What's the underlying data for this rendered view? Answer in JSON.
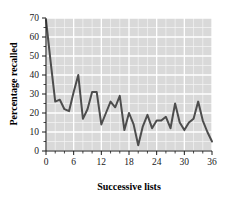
{
  "chart_data": {
    "type": "line",
    "title": "",
    "subtitle": "",
    "xlabel": "Successive lists",
    "ylabel": "Percentage recalled",
    "xlim": [
      0,
      36
    ],
    "ylim": [
      0,
      70
    ],
    "xticks": [
      0,
      6,
      12,
      18,
      24,
      30,
      36
    ],
    "xtick_labels": [
      "0",
      "6",
      "12",
      "18",
      "24",
      "30",
      "36"
    ],
    "xminor_step": 2,
    "yticks": [
      0,
      10,
      20,
      30,
      40,
      50,
      60,
      70
    ],
    "ytick_labels": [
      "0",
      "10",
      "20",
      "30",
      "40",
      "50",
      "60",
      "70"
    ],
    "yminor_step": 5,
    "grid": true,
    "grid_color": "#ffffff",
    "plot_background": "#d9d9d9",
    "line_color": "#4d4d4d",
    "line_width": 2,
    "legend": null,
    "legend_position": "none",
    "annotations": [],
    "x": [
      0,
      1,
      2,
      3,
      4,
      5,
      6,
      7,
      8,
      9,
      10,
      11,
      12,
      13,
      14,
      15,
      16,
      17,
      18,
      19,
      20,
      21,
      22,
      23,
      24,
      25,
      26,
      27,
      28,
      29,
      30,
      31,
      32,
      33,
      34,
      35,
      36
    ],
    "values": [
      69,
      47,
      26,
      27,
      22,
      21,
      31,
      40,
      17,
      22,
      31,
      31,
      14,
      20,
      26,
      23,
      29,
      11,
      20,
      14,
      3,
      13,
      19,
      12,
      16,
      16,
      18,
      12,
      25,
      15,
      11,
      15,
      17,
      26,
      16,
      10,
      5
    ],
    "series": [
      {
        "name": "Percentage recalled",
        "values": [
          69,
          47,
          26,
          27,
          22,
          21,
          31,
          40,
          17,
          22,
          31,
          31,
          14,
          20,
          26,
          23,
          29,
          11,
          20,
          14,
          3,
          13,
          19,
          12,
          16,
          16,
          18,
          12,
          25,
          15,
          11,
          15,
          17,
          26,
          16,
          10,
          5
        ]
      }
    ]
  }
}
